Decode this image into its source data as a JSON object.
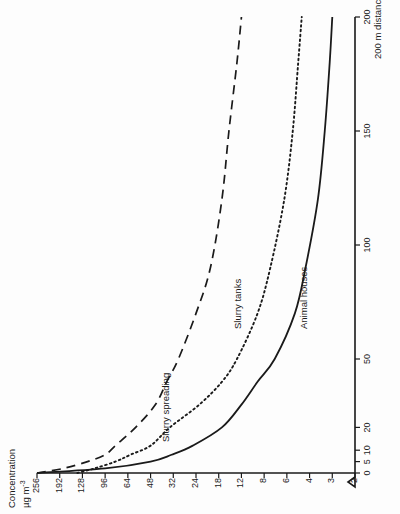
{
  "figure": {
    "y_axis_title_line1": "Concentration",
    "y_axis_title_line2": "µg m",
    "y_axis_title_exponent": "-3",
    "x_axis_title": "200 m distance"
  },
  "chart_data": {
    "type": "line",
    "title": "",
    "xlabel": "200 m distance",
    "ylabel": "Concentration µg m-3",
    "grid": false,
    "legend": "inline-curve-labels",
    "orientation": "page rotated 90° counter-clockwise",
    "x_axis": {
      "scale": "linear",
      "unit": "m",
      "range": [
        0,
        200
      ],
      "ticks": [
        0,
        5,
        10,
        20,
        50,
        100,
        150,
        200
      ],
      "tick_labels": [
        "0",
        "5",
        "10",
        "20",
        "50",
        "100",
        "150",
        "200"
      ],
      "break_symbol": true
    },
    "y_axis": {
      "scale": "log-like (equally spaced labels)",
      "unit": "µg m-3",
      "ticks": [
        256,
        192,
        128,
        96,
        64,
        48,
        32,
        24,
        18,
        12,
        8,
        6,
        4,
        3,
        2
      ],
      "tick_labels": [
        "256",
        "192",
        "128",
        "96",
        "64",
        "48",
        "32",
        "24",
        "18",
        "12",
        "8",
        "6",
        "4",
        "3",
        "2"
      ]
    },
    "series": [
      {
        "name": "Slurry spreading",
        "style": "dashed",
        "points": [
          {
            "x": 0,
            "y": 256
          },
          {
            "x": 2,
            "y": 180
          },
          {
            "x": 5,
            "y": 120
          },
          {
            "x": 8,
            "y": 96
          },
          {
            "x": 12,
            "y": 80
          },
          {
            "x": 20,
            "y": 58
          },
          {
            "x": 30,
            "y": 44
          },
          {
            "x": 40,
            "y": 36
          },
          {
            "x": 50,
            "y": 30
          },
          {
            "x": 70,
            "y": 24
          },
          {
            "x": 90,
            "y": 20
          },
          {
            "x": 120,
            "y": 17
          },
          {
            "x": 150,
            "y": 15
          },
          {
            "x": 180,
            "y": 13
          },
          {
            "x": 200,
            "y": 12
          }
        ]
      },
      {
        "name": "Slurry tanks",
        "style": "dotted",
        "points": [
          {
            "x": 0,
            "y": 140
          },
          {
            "x": 2,
            "y": 110
          },
          {
            "x": 5,
            "y": 80
          },
          {
            "x": 8,
            "y": 62
          },
          {
            "x": 12,
            "y": 48
          },
          {
            "x": 20,
            "y": 34
          },
          {
            "x": 30,
            "y": 23
          },
          {
            "x": 40,
            "y": 17
          },
          {
            "x": 50,
            "y": 13
          },
          {
            "x": 70,
            "y": 9
          },
          {
            "x": 90,
            "y": 7.4
          },
          {
            "x": 120,
            "y": 6.2
          },
          {
            "x": 150,
            "y": 5.4
          },
          {
            "x": 180,
            "y": 4.9
          },
          {
            "x": 200,
            "y": 4.6
          }
        ]
      },
      {
        "name": "Animal houses",
        "style": "solid",
        "points": [
          {
            "x": 0,
            "y": 256
          },
          {
            "x": 2,
            "y": 96
          },
          {
            "x": 5,
            "y": 48
          },
          {
            "x": 8,
            "y": 33
          },
          {
            "x": 12,
            "y": 25
          },
          {
            "x": 20,
            "y": 17
          },
          {
            "x": 30,
            "y": 12
          },
          {
            "x": 40,
            "y": 9
          },
          {
            "x": 50,
            "y": 7
          },
          {
            "x": 70,
            "y": 5.2
          },
          {
            "x": 90,
            "y": 4.3
          },
          {
            "x": 120,
            "y": 3.6
          },
          {
            "x": 150,
            "y": 3.3
          },
          {
            "x": 180,
            "y": 3.1
          },
          {
            "x": 200,
            "y": 3.0
          }
        ]
      }
    ]
  },
  "colors": {
    "ink": "#1a1a1a",
    "paper": "#fdfdfd"
  }
}
